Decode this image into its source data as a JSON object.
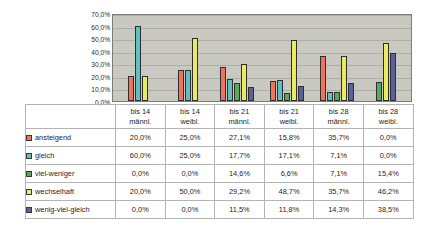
{
  "chart_data": {
    "type": "bar",
    "title": "",
    "subtitle": "",
    "xlabel": "",
    "ylabel": "",
    "grid": true,
    "legend_position": "table-row-labels",
    "ylim": [
      0,
      70
    ],
    "ytick_labels": [
      "70,0%",
      "60,0%",
      "50,0%",
      "40,0%",
      "30,0%",
      "20,0%",
      "10,0%",
      "0,0%"
    ],
    "ytick_values": [
      70,
      60,
      50,
      40,
      30,
      20,
      10,
      0
    ],
    "categories": [
      "bis 14 männl.",
      "bis 14 weibl.",
      "bis 21 männl.",
      "bis 21 weibl.",
      "bis 28 männl.",
      "bis 28 weibl."
    ],
    "category_lines": [
      [
        "bis 14",
        "männl."
      ],
      [
        "bis 14",
        "weibl."
      ],
      [
        "bis 21",
        "männl."
      ],
      [
        "bis 21",
        "weibl."
      ],
      [
        "bis 28",
        "männl."
      ],
      [
        "bis 28",
        "weibl."
      ]
    ],
    "series": [
      {
        "name": "ansteigend",
        "color": "#f2735b",
        "values": [
          20.0,
          25.0,
          27.1,
          15.8,
          35.7,
          0.0
        ],
        "labels": [
          "20,0%",
          "25,0%",
          "27,1%",
          "15,8%",
          "35,7%",
          "0,0%"
        ]
      },
      {
        "name": "gleich",
        "color": "#62bfc0",
        "values": [
          60.0,
          25.0,
          17.7,
          17.1,
          7.1,
          0.0
        ],
        "labels": [
          "60,0%",
          "25,0%",
          "17,7%",
          "17,1%",
          "7,1%",
          "0,0%"
        ]
      },
      {
        "name": "viel-weniger",
        "color": "#5aa85a",
        "values": [
          0.0,
          0.0,
          14.6,
          6.6,
          7.1,
          15.4
        ],
        "labels": [
          "0,0%",
          "0,0%",
          "14,6%",
          "6,6%",
          "7,1%",
          "15,4%"
        ]
      },
      {
        "name": "wechselhaft",
        "color": "#e8ea62",
        "values": [
          20.0,
          50.0,
          29.2,
          48.7,
          35.7,
          46.2
        ],
        "labels": [
          "20,0%",
          "50,0%",
          "29,2%",
          "48,7%",
          "35,7%",
          "46,2%"
        ]
      },
      {
        "name": "wenig-viel-gleich",
        "color": "#5b6199",
        "values": [
          0.0,
          0.0,
          11.5,
          11.8,
          14.3,
          38.5
        ],
        "labels": [
          "0,0%",
          "0,0%",
          "11,5%",
          "11,8%",
          "14,3%",
          "38,5%"
        ]
      }
    ]
  },
  "table": {
    "corner_label": "",
    "column_headers": [
      {
        "line1": "bis 14",
        "line2": "männl."
      },
      {
        "line1": "bis 14",
        "line2": "weibl."
      },
      {
        "line1": "bis 21",
        "line2": "männl."
      },
      {
        "line1": "bis 21",
        "line2": "weibl."
      },
      {
        "line1": "bis 28",
        "line2": "männl."
      },
      {
        "line1": "bis 28",
        "line2": "weibl."
      }
    ],
    "rows": [
      {
        "label": "ansteigend",
        "color": "#f2735b",
        "cells": [
          "20,0%",
          "25,0%",
          "27,1%",
          "15,8%",
          "35,7%",
          "0,0%"
        ]
      },
      {
        "label": "gleich",
        "color": "#62bfc0",
        "cells": [
          "60,0%",
          "25,0%",
          "17,7%",
          "17,1%",
          "7,1%",
          "0,0%"
        ]
      },
      {
        "label": "viel-weniger",
        "color": "#5aa85a",
        "cells": [
          "0,0%",
          "0,0%",
          "14,6%",
          "6,6%",
          "7,1%",
          "15,4%"
        ]
      },
      {
        "label": "wechselhaft",
        "color": "#e8ea62",
        "cells": [
          "20,0%",
          "50,0%",
          "29,2%",
          "48,7%",
          "35,7%",
          "46,2%"
        ]
      },
      {
        "label": "wenig-viel-gleich",
        "color": "#5b6199",
        "cells": [
          "0,0%",
          "0,0%",
          "11,5%",
          "11,8%",
          "14,3%",
          "38,5%"
        ]
      }
    ]
  },
  "style": {
    "plot_background": "#c9c9c1",
    "plot_border": "#7d7d76",
    "gridline_color": "#aeaea6",
    "page_background": "#ffffff",
    "bar_outline": "#2f2f2f",
    "table_border": "#b4b4b4"
  }
}
